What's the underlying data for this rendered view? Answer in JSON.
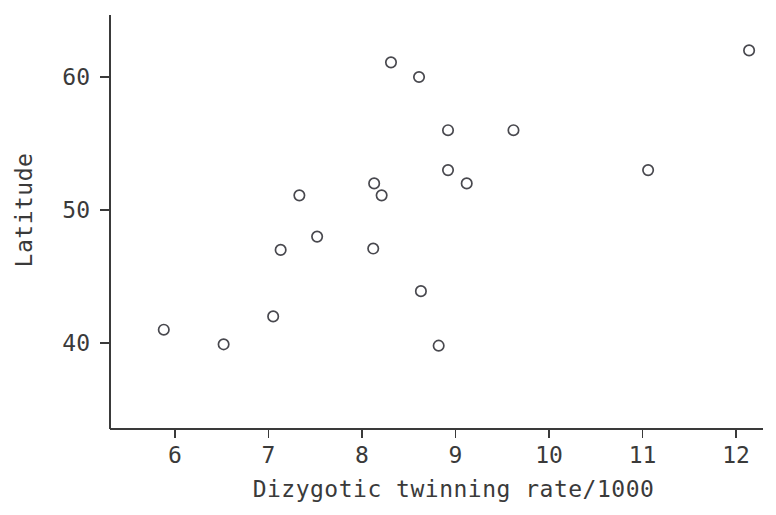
{
  "chart_data": {
    "type": "scatter",
    "title": "",
    "xlabel": "Dizygotic twinning rate/1000",
    "ylabel": "Latitude",
    "xlim": [
      5.5,
      12.45
    ],
    "ylim": [
      37.4,
      64.5
    ],
    "xticks": [
      6,
      7,
      8,
      9,
      10,
      11,
      12
    ],
    "yticks": [
      40,
      50,
      60
    ],
    "xtick_labels": [
      "6",
      "7",
      "8",
      "9",
      "10",
      "11",
      "12"
    ],
    "ytick_labels": [
      "40",
      "50",
      "60"
    ],
    "grid": false,
    "legend": null,
    "marker": "open-circle",
    "marker_color": "#48484e",
    "n_points": 19,
    "x": [
      5.88,
      6.52,
      7.05,
      7.13,
      7.33,
      7.52,
      8.12,
      8.13,
      8.21,
      8.31,
      8.61,
      8.63,
      8.82,
      8.92,
      8.92,
      9.12,
      9.62,
      11.06,
      12.14
    ],
    "y": [
      41.0,
      39.9,
      42.0,
      47.0,
      51.1,
      48.0,
      47.1,
      52.0,
      51.1,
      61.1,
      60.0,
      43.9,
      39.8,
      56.0,
      53.0,
      52.0,
      56.0,
      53.0,
      62.0
    ],
    "points": [
      {
        "x": 5.88,
        "y": 41.0
      },
      {
        "x": 6.52,
        "y": 39.9
      },
      {
        "x": 7.05,
        "y": 42.0
      },
      {
        "x": 7.13,
        "y": 47.0
      },
      {
        "x": 7.33,
        "y": 51.1
      },
      {
        "x": 7.52,
        "y": 48.0
      },
      {
        "x": 8.12,
        "y": 47.1
      },
      {
        "x": 8.13,
        "y": 52.0
      },
      {
        "x": 8.21,
        "y": 51.1
      },
      {
        "x": 8.31,
        "y": 61.1
      },
      {
        "x": 8.61,
        "y": 60.0
      },
      {
        "x": 8.63,
        "y": 43.9
      },
      {
        "x": 8.82,
        "y": 39.8
      },
      {
        "x": 8.92,
        "y": 56.0
      },
      {
        "x": 8.92,
        "y": 53.0
      },
      {
        "x": 9.12,
        "y": 52.0
      },
      {
        "x": 9.62,
        "y": 56.0
      },
      {
        "x": 11.06,
        "y": 53.0
      },
      {
        "x": 12.14,
        "y": 62.0
      }
    ]
  },
  "axes": {
    "y_axis_top_value": 64.5,
    "y_axis_bottom_value": 37.4,
    "x_axis_left_value": 5.5,
    "x_axis_right_value": 12.45
  }
}
